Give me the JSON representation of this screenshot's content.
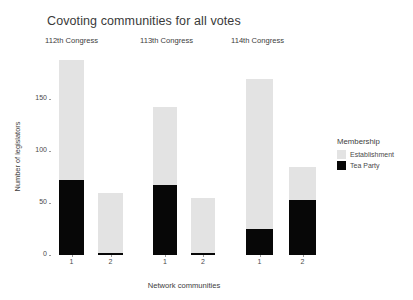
{
  "chart_data": {
    "type": "bar",
    "title": "Covoting communities for all votes",
    "xlabel": "Network communities",
    "ylabel": "Number of legislators",
    "ylim": [
      0,
      195
    ],
    "yticks": [
      0,
      50,
      100,
      150
    ],
    "ytick_labels": [
      "0",
      "50",
      "100",
      "150"
    ],
    "grid": false,
    "stacked": true,
    "legend": {
      "title": "Membership",
      "position": "right",
      "entries": [
        {
          "name": "Establishment",
          "color": "#e3e3e3"
        },
        {
          "name": "Tea Party",
          "color": "#070707"
        }
      ]
    },
    "facets": [
      {
        "label": "112th Congress",
        "categories": [
          "1",
          "2"
        ],
        "series": [
          {
            "name": "Establishment",
            "values": [
              115,
              58
            ]
          },
          {
            "name": "Tea Party",
            "values": [
              72,
              2
            ]
          }
        ],
        "totals": [
          187,
          60
        ]
      },
      {
        "label": "113th Congress",
        "categories": [
          "1",
          "2"
        ],
        "series": [
          {
            "name": "Establishment",
            "values": [
              75,
              53
            ]
          },
          {
            "name": "Tea Party",
            "values": [
              67,
              2
            ]
          }
        ],
        "totals": [
          142,
          55
        ]
      },
      {
        "label": "114th Congress",
        "categories": [
          "1",
          "2"
        ],
        "series": [
          {
            "name": "Establishment",
            "values": [
              144,
              32
            ]
          },
          {
            "name": "Tea Party",
            "values": [
              25,
              53
            ]
          }
        ],
        "totals": [
          169,
          85
        ]
      }
    ]
  }
}
